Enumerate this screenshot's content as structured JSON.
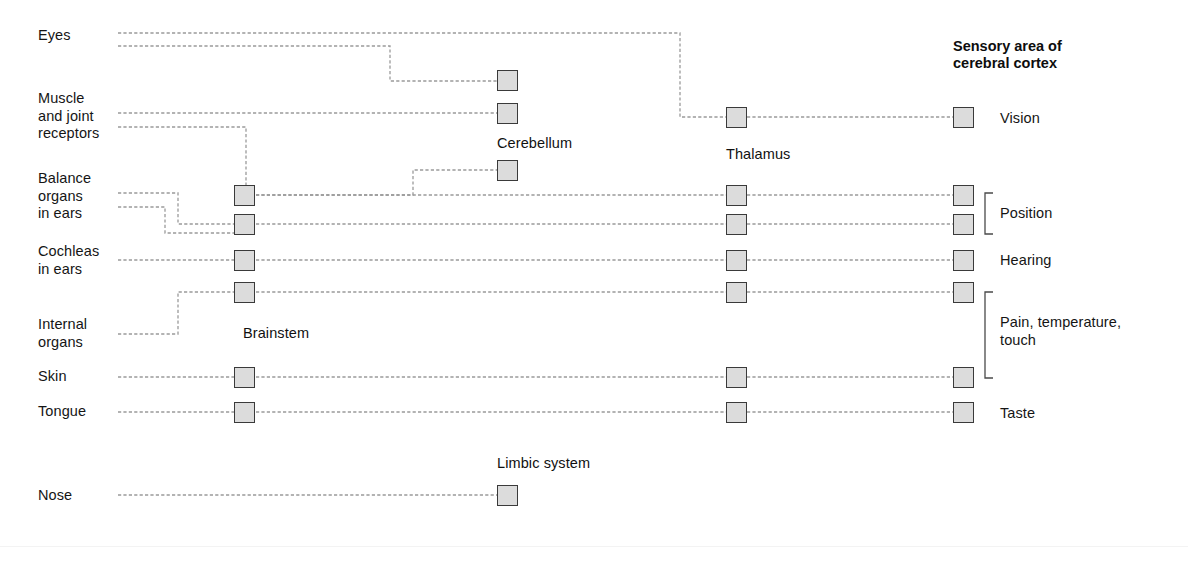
{
  "figure": {
    "title_right": "Sensory area of\ncerebral cortex",
    "background": "#ffffff",
    "wire_color": "#9a9a9a",
    "node_fill": "#dcdcdc",
    "node_stroke": "#3a3a3a",
    "text_color": "#151515"
  },
  "sources": [
    {
      "id": "eyes",
      "label": "Eyes",
      "x": 38,
      "y": 27
    },
    {
      "id": "muscle",
      "label": "Muscle\nand joint\nreceptors",
      "x": 38,
      "y": 90
    },
    {
      "id": "balance",
      "label": "Balance\norgans\nin ears",
      "x": 38,
      "y": 170
    },
    {
      "id": "cochleas",
      "label": "Cochleas\nin ears",
      "x": 38,
      "y": 243
    },
    {
      "id": "internal",
      "label": "Internal\norgans",
      "x": 38,
      "y": 316
    },
    {
      "id": "skin",
      "label": "Skin",
      "x": 38,
      "y": 368
    },
    {
      "id": "tongue",
      "label": "Tongue",
      "x": 38,
      "y": 403
    },
    {
      "id": "nose",
      "label": "Nose",
      "x": 38,
      "y": 487
    }
  ],
  "structures": [
    {
      "id": "cerebellum",
      "label": "Cerebellum",
      "x": 497,
      "y": 135
    },
    {
      "id": "brainstem",
      "label": "Brainstem",
      "x": 243,
      "y": 325
    },
    {
      "id": "thalamus",
      "label": "Thalamus",
      "x": 726,
      "y": 146
    },
    {
      "id": "limbic",
      "label": "Limbic system",
      "x": 497,
      "y": 455
    }
  ],
  "columns": {
    "brainstem_x": 234,
    "cerebellum_x": 497,
    "thalamus_x": 726,
    "cortex_x": 953,
    "limbic_x": 497
  },
  "nodes": [
    {
      "id": "cerebellum-1",
      "column": "cerebellum",
      "x": 497,
      "y": 70
    },
    {
      "id": "cerebellum-2",
      "column": "cerebellum",
      "x": 497,
      "y": 103
    },
    {
      "id": "cerebellum-3",
      "column": "cerebellum",
      "x": 497,
      "y": 160
    },
    {
      "id": "brainstem-1",
      "column": "brainstem",
      "x": 234,
      "y": 185
    },
    {
      "id": "brainstem-2",
      "column": "brainstem",
      "x": 234,
      "y": 214
    },
    {
      "id": "brainstem-3",
      "column": "brainstem",
      "x": 234,
      "y": 250
    },
    {
      "id": "brainstem-4",
      "column": "brainstem",
      "x": 234,
      "y": 282
    },
    {
      "id": "brainstem-5",
      "column": "brainstem",
      "x": 234,
      "y": 367
    },
    {
      "id": "brainstem-6",
      "column": "brainstem",
      "x": 234,
      "y": 402
    },
    {
      "id": "thalamus-1",
      "column": "thalamus",
      "x": 726,
      "y": 107
    },
    {
      "id": "thalamus-2",
      "column": "thalamus",
      "x": 726,
      "y": 185
    },
    {
      "id": "thalamus-3",
      "column": "thalamus",
      "x": 726,
      "y": 214
    },
    {
      "id": "thalamus-4",
      "column": "thalamus",
      "x": 726,
      "y": 250
    },
    {
      "id": "thalamus-5",
      "column": "thalamus",
      "x": 726,
      "y": 282
    },
    {
      "id": "thalamus-6",
      "column": "thalamus",
      "x": 726,
      "y": 367
    },
    {
      "id": "thalamus-7",
      "column": "thalamus",
      "x": 726,
      "y": 402
    },
    {
      "id": "cortex-1",
      "column": "cortex",
      "x": 953,
      "y": 107
    },
    {
      "id": "cortex-2",
      "column": "cortex",
      "x": 953,
      "y": 185
    },
    {
      "id": "cortex-3",
      "column": "cortex",
      "x": 953,
      "y": 214
    },
    {
      "id": "cortex-4",
      "column": "cortex",
      "x": 953,
      "y": 250
    },
    {
      "id": "cortex-5",
      "column": "cortex",
      "x": 953,
      "y": 282
    },
    {
      "id": "cortex-6",
      "column": "cortex",
      "x": 953,
      "y": 367
    },
    {
      "id": "cortex-7",
      "column": "cortex",
      "x": 953,
      "y": 402
    },
    {
      "id": "limbic-1",
      "column": "limbic",
      "x": 497,
      "y": 485
    }
  ],
  "cortex_labels": [
    {
      "id": "vision",
      "label": "Vision",
      "x": 1000,
      "y": 110
    },
    {
      "id": "position",
      "label": "Position",
      "x": 1000,
      "y": 205
    },
    {
      "id": "hearing",
      "label": "Hearing",
      "x": 1000,
      "y": 252
    },
    {
      "id": "pain",
      "label": "Pain, temperature,\ntouch",
      "x": 1000,
      "y": 314
    },
    {
      "id": "taste",
      "label": "Taste",
      "x": 1000,
      "y": 405
    }
  ],
  "brackets": [
    {
      "id": "position-bracket",
      "x": 985,
      "y_top": 193,
      "y_bottom": 234,
      "depth": 8
    },
    {
      "id": "pain-bracket",
      "x": 985,
      "y_top": 292,
      "y_bottom": 378,
      "depth": 8
    }
  ],
  "wires": [
    {
      "id": "eyes-to-thalamus",
      "from": "eyes",
      "to": "thalamus-1",
      "points": "118,33 680,33 680,117 726,117"
    },
    {
      "id": "eyes-to-cerebellum",
      "from": "eyes",
      "to": "cerebellum-1",
      "points": "118,46 390,46 390,81 497,81"
    },
    {
      "id": "muscle-to-cerebellum",
      "from": "muscle",
      "to": "cerebellum-2",
      "points": "118,113 497,113"
    },
    {
      "id": "muscle-to-brainstem",
      "from": "muscle",
      "to": "brainstem-1",
      "points": "118,127 246,127 246,185"
    },
    {
      "id": "balance-to-brainstem-2",
      "from": "balance",
      "to": "brainstem-2",
      "points": "118,193 178,193 178,224 234,224"
    },
    {
      "id": "balance-to-brainstem-2b",
      "from": "balance",
      "to": "brainstem-2",
      "points": "118,207 165,207 165,233 234,233"
    },
    {
      "id": "cochleas-to-brainstem",
      "from": "cochleas",
      "to": "brainstem-3",
      "points": "118,260 234,260"
    },
    {
      "id": "internal-to-brainstem",
      "from": "internal",
      "to": "brainstem-4",
      "points": "118,334 178,334 178,292 234,292"
    },
    {
      "id": "skin-to-brainstem",
      "from": "skin",
      "to": "brainstem-5",
      "points": "118,377 234,377"
    },
    {
      "id": "tongue-to-brainstem",
      "from": "tongue",
      "to": "brainstem-6",
      "points": "118,412 234,412"
    },
    {
      "id": "nose-to-limbic",
      "from": "nose",
      "to": "limbic-1",
      "points": "118,495 497,495"
    },
    {
      "id": "brainstem-1-to-cerebellum-3",
      "from": "brainstem-1",
      "to": "cerebellum-3",
      "points": "256,195 413,195 413,170 497,170"
    },
    {
      "id": "brainstem-1-to-thalamus-2",
      "from": "brainstem-1",
      "to": "thalamus-2",
      "points": "256,195 726,195"
    },
    {
      "id": "brainstem-2-to-thalamus-3",
      "from": "brainstem-2",
      "to": "thalamus-3",
      "points": "256,224 726,224"
    },
    {
      "id": "brainstem-3-to-thalamus-4",
      "from": "brainstem-3",
      "to": "thalamus-4",
      "points": "256,260 726,260"
    },
    {
      "id": "brainstem-4-to-thalamus-5",
      "from": "brainstem-4",
      "to": "thalamus-5",
      "points": "256,292 726,292"
    },
    {
      "id": "brainstem-5-to-thalamus-6",
      "from": "brainstem-5",
      "to": "thalamus-6",
      "points": "256,377 726,377"
    },
    {
      "id": "brainstem-6-to-thalamus-7",
      "from": "brainstem-6",
      "to": "thalamus-7",
      "points": "256,412 726,412"
    },
    {
      "id": "thalamus-1-to-cortex-1",
      "from": "thalamus-1",
      "to": "cortex-1",
      "points": "747,117 953,117"
    },
    {
      "id": "thalamus-2-to-cortex-2",
      "from": "thalamus-2",
      "to": "cortex-2",
      "points": "747,195 953,195"
    },
    {
      "id": "thalamus-3-to-cortex-3",
      "from": "thalamus-3",
      "to": "cortex-3",
      "points": "747,224 953,224"
    },
    {
      "id": "thalamus-4-to-cortex-4",
      "from": "thalamus-4",
      "to": "cortex-4",
      "points": "747,260 953,260"
    },
    {
      "id": "thalamus-5-to-cortex-5",
      "from": "thalamus-5",
      "to": "cortex-5",
      "points": "747,292 953,292"
    },
    {
      "id": "thalamus-6-to-cortex-6",
      "from": "thalamus-6",
      "to": "cortex-6",
      "points": "747,377 953,377"
    },
    {
      "id": "thalamus-7-to-cortex-7",
      "from": "thalamus-7",
      "to": "cortex-7",
      "points": "747,412 953,412"
    }
  ]
}
